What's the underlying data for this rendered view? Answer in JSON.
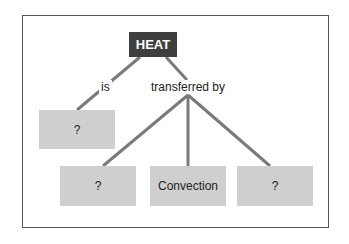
{
  "diagram": {
    "root": {
      "label": "HEAT",
      "color": "#3f3f3f"
    },
    "edges": [
      {
        "label": "is",
        "to": "unknown_1"
      },
      {
        "label": "transferred by",
        "to": [
          "unknown_2",
          "convection",
          "unknown_3"
        ]
      }
    ],
    "nodes": {
      "unknown_1": "?",
      "unknown_2": "?",
      "convection": "Convection",
      "unknown_3": "?"
    },
    "node_fill": "#cfcfcf",
    "line_color": "#7a7a7a"
  }
}
